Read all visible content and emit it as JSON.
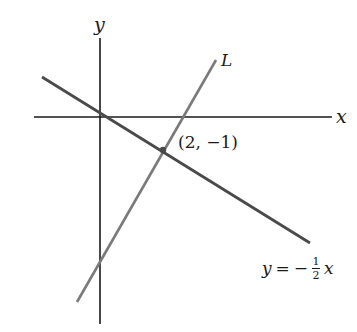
{
  "diagram": {
    "type": "coordinate-plane",
    "axes": {
      "x_label": "x",
      "y_label": "y",
      "origin_px": [
        100,
        117
      ],
      "x_axis_px": [
        34,
        332
      ],
      "y_axis_px": [
        38,
        324
      ],
      "color": "#1a1a1a"
    },
    "lines": [
      {
        "name": "y = -1/2 x",
        "label_parts": {
          "lhs": "y",
          "eq": "=",
          "sign": "−",
          "num": "1",
          "den": "2",
          "var": "x"
        },
        "from_px": [
          42,
          77
        ],
        "to_px": [
          310,
          243
        ],
        "color": "#555555"
      },
      {
        "name": "L",
        "label": "L",
        "from_px": [
          77,
          302
        ],
        "to_px": [
          216,
          60
        ],
        "color": "#777777"
      }
    ],
    "intersection": {
      "label": "(2, −1)",
      "px": [
        163,
        150
      ],
      "coords": [
        2,
        -1
      ],
      "color": "#555555"
    }
  }
}
